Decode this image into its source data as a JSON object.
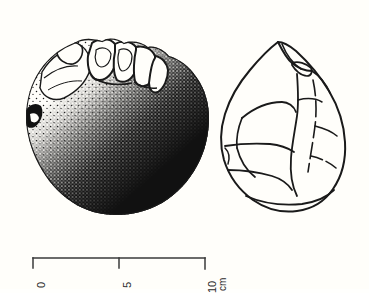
{
  "figure": {
    "type": "archaeological-lithic-illustration",
    "views": [
      {
        "id": "left-view",
        "name": "stippled-shaded-view",
        "rendering": "stipple-and-solid-black shading",
        "outline_shape": "sub-circular / discoidal",
        "notes": "light stippled upper-left surface grading to solid black lower-right shadow; notched flaked ridge across upper edge"
      },
      {
        "id": "right-view",
        "name": "line-drawing-view",
        "rendering": "open line drawing, no shading",
        "outline_shape": "pear / teardrop (pointed apex, broad rounded base)",
        "notes": "interior lines mark flake-scar ridges and arrises"
      }
    ]
  },
  "scale": {
    "name": "scale-bar",
    "unit": "cm",
    "unit_label": "cm",
    "ticks": [
      {
        "value": 0,
        "label": "0"
      },
      {
        "value": 5,
        "label": "5"
      },
      {
        "value": 10,
        "label": "10"
      }
    ],
    "orientation": "horizontal",
    "label_rotation_deg": -90,
    "length_cm": 10
  },
  "colors": {
    "background": "#fffefa",
    "ink": "#1a1a1a",
    "scale_ink": "#3a3a3a"
  }
}
